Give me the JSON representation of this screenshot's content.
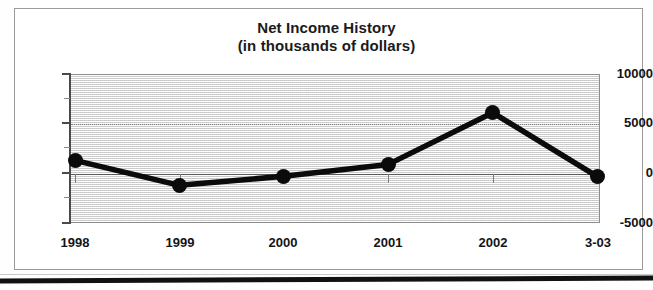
{
  "chart_data": {
    "type": "line",
    "title": "Net Income History",
    "subtitle": "(in thousands of dollars)",
    "xlabel": "",
    "ylabel": "",
    "categories": [
      "1998",
      "1999",
      "2000",
      "2001",
      "2002",
      "3-03"
    ],
    "values": [
      1300,
      -1200,
      -300,
      900,
      6100,
      -300
    ],
    "series": [
      {
        "name": "Net Income",
        "values": [
          1300,
          -1200,
          -300,
          900,
          6100,
          -300
        ]
      }
    ],
    "ylim": [
      -5000,
      10000
    ],
    "yticks": [
      10000,
      5000,
      0,
      -5000
    ],
    "ytick_labels": [
      "10000",
      "5000",
      "0",
      "-5000"
    ],
    "yminor_ticks": [
      7500,
      2500,
      -2500
    ],
    "grid": true,
    "legend": false,
    "legend_position": "none",
    "marker": "filled-circle",
    "line_color": "#0b0b0b",
    "marker_color": "#0b0b0b",
    "plot_background": "#ebebeb",
    "figure_background": "#ffffff"
  },
  "figure": {
    "title_line1": "Net Income History",
    "title_line2": "(in thousands of dollars)"
  }
}
